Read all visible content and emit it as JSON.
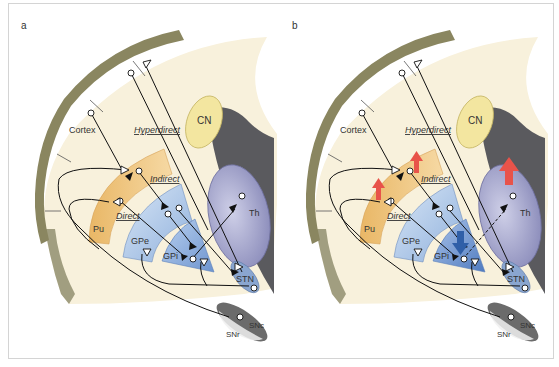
{
  "figure": {
    "panels": [
      {
        "id": "a",
        "label": "a",
        "labels": {
          "cortex": "Cortex",
          "hyperdirect": "Hyperdirect",
          "indirect": "Indirect",
          "direct": "Direct",
          "cn": "CN",
          "pu": "Pu",
          "gpe": "GPe",
          "gpi": "GPi",
          "th": "Th",
          "stn": "STN",
          "snr": "SNr",
          "snc": "SNc"
        },
        "activity_arrows": []
      },
      {
        "id": "b",
        "label": "b",
        "labels": {
          "cortex": "Cortex",
          "hyperdirect": "Hyperdirect",
          "indirect": "Indirect",
          "direct": "Direct",
          "cn": "CN",
          "pu": "Pu",
          "gpe": "GPe",
          "gpi": "GPi",
          "th": "Th",
          "stn": "STN",
          "snr": "SNr",
          "snc": "SNc"
        },
        "activity_arrows": [
          {
            "region": "Pu (direct)",
            "direction": "up",
            "color": "#e8534a"
          },
          {
            "region": "Pu (indirect)",
            "direction": "up",
            "color": "#e8534a"
          },
          {
            "region": "Th",
            "direction": "up",
            "color": "#e8534a"
          },
          {
            "region": "GPi",
            "direction": "down",
            "color": "#2f5fa8"
          }
        ],
        "dashed_projection": "GPi-to-Th"
      }
    ],
    "colors": {
      "cortex_rim": "#8a8660",
      "brain_fill": "#f8f1dc",
      "striatum": "#f0c27a",
      "pallidum": "#a9c4e6",
      "gpi": "#7fa5d6",
      "thalamus": "#a8a8cc",
      "cn": "#f3e6a0",
      "ventricle": "#5a5a5e",
      "stn": "#8aa6d0",
      "substantia_nigra": "#6b6b6b",
      "increase_arrow": "#e8534a",
      "decrease_arrow": "#2f5fa8"
    }
  }
}
